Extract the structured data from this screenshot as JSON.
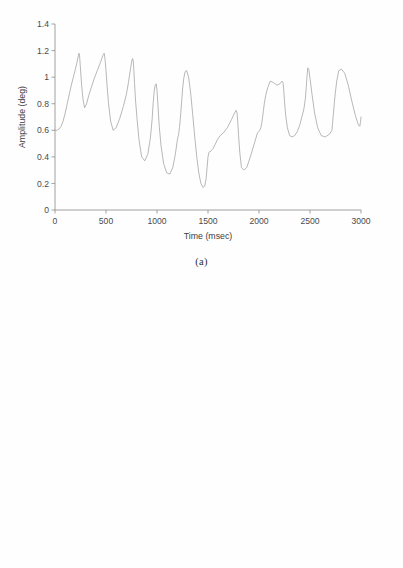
{
  "figure": {
    "background_color": "#ffffff",
    "line_color": "#a0a0a0",
    "axis_color": "#8c8c8c",
    "text_color": "#3c3c3c"
  },
  "panels": [
    {
      "id": "panel-a",
      "caption": "(a)"
    },
    {
      "id": "panel-b",
      "caption": "(b)"
    }
  ],
  "chart_data": [
    {
      "type": "line",
      "title": "",
      "subtitle": "",
      "panel_label": "(a)",
      "xlabel": "Time (msec)",
      "ylabel": "Amplitude (deg)",
      "xlim": [
        0,
        3000
      ],
      "ylim": [
        0,
        1.4
      ],
      "xticks": [
        0,
        500,
        1000,
        1500,
        2000,
        2500,
        3000
      ],
      "xticklabels": [
        "0",
        "500",
        "1000",
        "1500",
        "2000",
        "2500",
        "3000"
      ],
      "yticks": [
        0,
        0.2,
        0.4,
        0.6,
        0.8,
        1.0,
        1.2,
        1.4
      ],
      "yticklabels": [
        "0",
        "0.2",
        "0.4",
        "0.6",
        "0.8",
        "1",
        "1.2",
        "1.4"
      ],
      "grid": false,
      "legend": null,
      "legend_position": "none",
      "series": [
        {
          "name": "Amplitude",
          "color": "#a0a0a0",
          "x": [
            0,
            20,
            40,
            60,
            80,
            100,
            120,
            140,
            160,
            180,
            200,
            215,
            228,
            235,
            240,
            250,
            262,
            275,
            290,
            310,
            330,
            355,
            380,
            400,
            420,
            440,
            455,
            468,
            476,
            482,
            490,
            500,
            512,
            525,
            545,
            570,
            600,
            635,
            670,
            700,
            720,
            740,
            752,
            760,
            766,
            772,
            780,
            790,
            805,
            825,
            850,
            880,
            910,
            935,
            952,
            962,
            972,
            982,
            992,
            1000,
            1010,
            1022,
            1040,
            1065,
            1095,
            1125,
            1155,
            1180,
            1200,
            1212,
            1220,
            1228,
            1236,
            1244,
            1252,
            1262,
            1275,
            1290,
            1310,
            1330,
            1350,
            1370,
            1390,
            1410,
            1430,
            1450,
            1468,
            1482,
            1492,
            1500,
            1508,
            1516,
            1524,
            1534,
            1548,
            1568,
            1592,
            1620,
            1650,
            1690,
            1730,
            1760,
            1775,
            1785,
            1792,
            1800,
            1812,
            1828,
            1850,
            1880,
            1915,
            1950,
            1985,
            2008,
            2018,
            2026,
            2034,
            2042,
            2052,
            2065,
            2085,
            2110,
            2140,
            2175,
            2205,
            2225,
            2235,
            2242,
            2250,
            2262,
            2278,
            2300,
            2325,
            2350,
            2375,
            2400,
            2420,
            2440,
            2455,
            2463,
            2470,
            2478,
            2488,
            2500,
            2520,
            2545,
            2575,
            2610,
            2650,
            2690,
            2715,
            2722,
            2730,
            2738,
            2748,
            2762,
            2782,
            2808,
            2840,
            2875,
            2910,
            2945,
            2975,
            2988,
            2995,
            3000
          ],
          "y": [
            0.6,
            0.6,
            0.61,
            0.63,
            0.67,
            0.73,
            0.8,
            0.87,
            0.94,
            1.0,
            1.06,
            1.11,
            1.16,
            1.18,
            1.17,
            1.06,
            0.93,
            0.83,
            0.77,
            0.8,
            0.86,
            0.92,
            0.98,
            1.02,
            1.06,
            1.1,
            1.13,
            1.16,
            1.17,
            1.18,
            1.14,
            1.05,
            0.92,
            0.8,
            0.67,
            0.6,
            0.62,
            0.69,
            0.78,
            0.87,
            0.96,
            1.06,
            1.12,
            1.14,
            1.13,
            1.07,
            0.95,
            0.82,
            0.68,
            0.52,
            0.4,
            0.37,
            0.42,
            0.54,
            0.68,
            0.8,
            0.89,
            0.94,
            0.95,
            0.9,
            0.78,
            0.63,
            0.48,
            0.35,
            0.28,
            0.27,
            0.32,
            0.42,
            0.53,
            0.57,
            0.62,
            0.68,
            0.76,
            0.84,
            0.92,
            0.99,
            1.04,
            1.05,
            1.0,
            0.88,
            0.72,
            0.55,
            0.4,
            0.28,
            0.2,
            0.17,
            0.18,
            0.24,
            0.33,
            0.4,
            0.43,
            0.44,
            0.44,
            0.45,
            0.46,
            0.49,
            0.53,
            0.56,
            0.58,
            0.62,
            0.68,
            0.73,
            0.75,
            0.73,
            0.66,
            0.56,
            0.43,
            0.32,
            0.3,
            0.32,
            0.4,
            0.49,
            0.58,
            0.6,
            0.62,
            0.65,
            0.69,
            0.74,
            0.8,
            0.86,
            0.92,
            0.97,
            0.96,
            0.94,
            0.95,
            0.97,
            0.96,
            0.91,
            0.82,
            0.71,
            0.62,
            0.56,
            0.55,
            0.56,
            0.59,
            0.64,
            0.7,
            0.76,
            0.84,
            0.92,
            1.0,
            1.07,
            1.06,
            0.99,
            0.87,
            0.73,
            0.62,
            0.56,
            0.55,
            0.57,
            0.6,
            0.66,
            0.73,
            0.8,
            0.88,
            0.97,
            1.05,
            1.06,
            1.03,
            0.94,
            0.82,
            0.71,
            0.64,
            0.63,
            0.66,
            0.7,
            0.74,
            0.76,
            0.76,
            0.75,
            0.74,
            0.74,
            0.74,
            0.75,
            0.76,
            0.78,
            0.79,
            0.76,
            0.66,
            0.52,
            0.38,
            0.26,
            0.18,
            0.14,
            0.17,
            0.24,
            0.33,
            0.41,
            0.47,
            0.52,
            0.56,
            0.6,
            0.64,
            0.68,
            0.73,
            0.76,
            0.72,
            0.62,
            0.5,
            0.38,
            0.3,
            0.27,
            0.3,
            0.36,
            0.44,
            0.52,
            0.6,
            0.67,
            0.74,
            0.8,
            0.84,
            0.86,
            0.87,
            0.9,
            0.94,
            0.88,
            0.7,
            0.55,
            0.46
          ]
        }
      ]
    },
    {
      "type": "line",
      "title": "",
      "subtitle": "",
      "panel_label": "(b)",
      "xlabel": "Time (msec)",
      "ylabel": "Amplitude (deg)",
      "xlim": [
        0,
        3000
      ],
      "ylim": [
        0,
        6
      ],
      "xticks": [
        0,
        500,
        1000,
        1500,
        2000,
        2500,
        3000
      ],
      "xticklabels": [
        "0",
        "500",
        "1000",
        "1500",
        "2000",
        "2500",
        "3000"
      ],
      "yticks": [
        0,
        1,
        2,
        3,
        4,
        5,
        6
      ],
      "yticklabels": [
        "0",
        "1",
        "2",
        "3",
        "4",
        "5",
        "6"
      ],
      "grid": false,
      "legend": null,
      "legend_position": "none",
      "series": [
        {
          "name": "Amplitude",
          "color": "#a0a0a0",
          "x": [
            0,
            20,
            45,
            70,
            95,
            120,
            140,
            155,
            170,
            185,
            200,
            212,
            220,
            228,
            234,
            240,
            248,
            258,
            270,
            285,
            300,
            312,
            322,
            330,
            338,
            344,
            350,
            356,
            362,
            368,
            374,
            382,
            392,
            404,
            418,
            434,
            452,
            472,
            494,
            518,
            545,
            572,
            600,
            628,
            652,
            668,
            678,
            686,
            692,
            698,
            704,
            710,
            718,
            728,
            740,
            756,
            776,
            798,
            820,
            840,
            856,
            868,
            876,
            882,
            888,
            894,
            900,
            906,
            914,
            924,
            936,
            950,
            966,
            984,
            1002,
            1022,
            1044,
            1068,
            1094,
            1120,
            1146,
            1170,
            1192,
            1212,
            1232,
            1252,
            1272,
            1292,
            1312,
            1330,
            1348,
            1368,
            1390,
            1414,
            1440,
            1466,
            1492,
            1518,
            1544,
            1570,
            1596,
            1622,
            1648,
            1674,
            1700,
            1726,
            1752,
            1778,
            1804,
            1830,
            1856,
            1882,
            1908,
            1930,
            1950,
            1968,
            1986,
            2004,
            2022,
            2040,
            2058,
            2076,
            2096,
            2118,
            2142,
            2168,
            2196,
            2224,
            2252,
            2280,
            2308,
            2336,
            2364,
            2392,
            2420,
            2448,
            2476,
            2504,
            2532,
            2560,
            2588,
            2616,
            2644,
            2672,
            2700,
            2728,
            2756,
            2784,
            2812,
            2840,
            2868,
            2896,
            2924,
            2950,
            2968,
            2982,
            2995
          ],
          "y": [
            2.6,
            2.64,
            2.72,
            2.8,
            2.88,
            2.96,
            3.02,
            3.06,
            3.1,
            3.12,
            3.16,
            3.24,
            3.33,
            3.36,
            3.3,
            3.1,
            2.8,
            2.48,
            2.18,
            1.88,
            1.66,
            1.56,
            1.54,
            1.62,
            1.74,
            1.86,
            1.96,
            2.04,
            2.09,
            2.12,
            2.08,
            1.92,
            1.68,
            1.42,
            1.18,
            0.98,
            0.85,
            0.8,
            0.84,
            0.92,
            1.02,
            1.12,
            1.22,
            1.34,
            1.48,
            1.64,
            1.8,
            1.94,
            2.02,
            2.04,
            1.96,
            1.74,
            1.44,
            1.12,
            0.84,
            0.62,
            0.48,
            0.41,
            0.44,
            0.56,
            0.72,
            0.9,
            1.06,
            1.2,
            1.34,
            1.5,
            1.68,
            1.86,
            2.0,
            2.02,
            1.92,
            1.74,
            1.56,
            1.44,
            1.42,
            1.5,
            1.42,
            1.36,
            1.4,
            1.48,
            1.58,
            1.7,
            1.82,
            1.94,
            2.06,
            2.18,
            2.3,
            2.4,
            2.5,
            2.62,
            2.74,
            2.84,
            2.88,
            2.92,
            2.95,
            3.0,
            3.06,
            3.12,
            3.18,
            3.24,
            3.28,
            3.34,
            3.4,
            3.46,
            3.52,
            3.58,
            3.62,
            3.66,
            3.68,
            3.66,
            3.7,
            3.72,
            3.74,
            3.76,
            3.72,
            3.7,
            3.66,
            3.62,
            3.58,
            3.58,
            3.6,
            3.64,
            3.7,
            3.76,
            3.82,
            3.9,
            3.98,
            4.06,
            4.14,
            4.2,
            4.24,
            4.28,
            4.3,
            4.34,
            4.38,
            4.42,
            4.44,
            4.46,
            4.5,
            4.54,
            4.58,
            4.6,
            4.62,
            4.66,
            4.7,
            4.72,
            4.74,
            4.78,
            4.82,
            4.84,
            4.86,
            4.84,
            4.82,
            4.8
          ]
        }
      ]
    }
  ]
}
